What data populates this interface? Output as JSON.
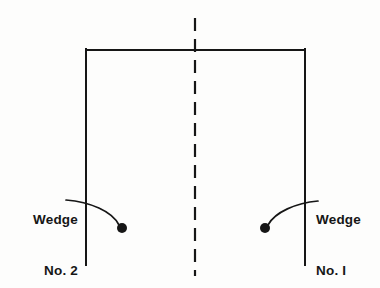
{
  "figure": {
    "kind": "engineering-line-drawing",
    "background_color": "#fdfdfc",
    "line_color": "#161616"
  },
  "outline": {
    "name": "open-bottom-rectangle",
    "top_edge": {
      "x1": 86,
      "y1": 50,
      "x2": 305,
      "y2": 50
    },
    "left_edge": {
      "x1": 86,
      "y1": 50,
      "x2": 86,
      "y2": 265
    },
    "right_edge": {
      "x1": 305,
      "y1": 50,
      "x2": 305,
      "y2": 265
    },
    "stroke_width": 2.0
  },
  "centerline": {
    "name": "vertical-dashed-centerline",
    "x": 195,
    "y_start": 18,
    "y_end": 276,
    "dash_length": 13,
    "gap_length": 8,
    "stroke_width": 2.2,
    "color": "#161616"
  },
  "callouts": [
    {
      "id": "wedge-1",
      "label_line_1": "Wedge",
      "label_line_2": "No. I",
      "side": "right",
      "text_x": 316,
      "text_y": 177,
      "text_align": "left",
      "marker": {
        "cx": 265,
        "cy": 228,
        "r": 5.0
      },
      "leader_start": {
        "x": 318,
        "y": 201
      },
      "leader_control_1": {
        "x": 296,
        "y": 203
      },
      "leader_control_2": {
        "x": 275,
        "y": 212
      },
      "leader_end": {
        "x": 268,
        "y": 225
      }
    },
    {
      "id": "wedge-2",
      "label_line_1": "Wedge",
      "label_line_2": "No. 2",
      "side": "left",
      "text_x": 6,
      "text_y": 177,
      "text_align": "right",
      "marker": {
        "cx": 122,
        "cy": 228,
        "r": 5.0
      },
      "leader_start": {
        "x": 66,
        "y": 200
      },
      "leader_control_1": {
        "x": 90,
        "y": 202
      },
      "leader_control_2": {
        "x": 112,
        "y": 211
      },
      "leader_end": {
        "x": 119,
        "y": 225
      }
    }
  ]
}
